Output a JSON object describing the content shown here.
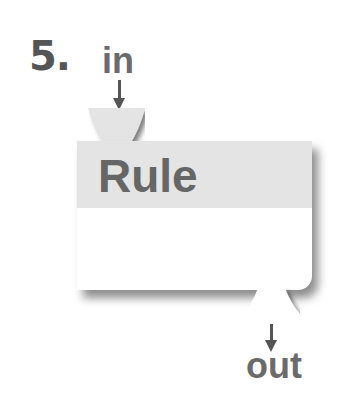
{
  "diagram": {
    "step_number": "5.",
    "input_label": "in",
    "output_label": "out",
    "node": {
      "title": "Rule",
      "header_color": "#e4e4e4",
      "body_color": "#ffffff"
    },
    "text_color": "#666666"
  }
}
